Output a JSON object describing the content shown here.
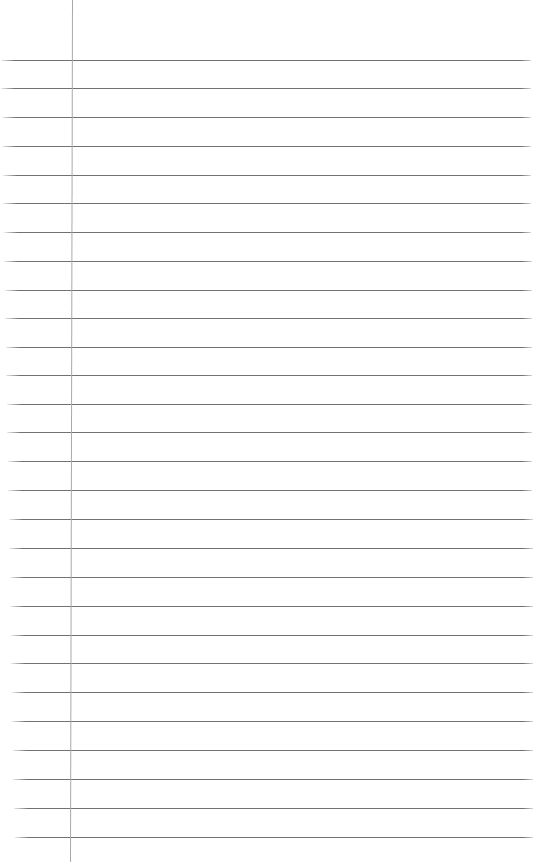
{
  "document": {
    "type": "lined-notebook-paper",
    "page_width": 536,
    "page_height": 866,
    "background_color": "#ffffff",
    "written_text": "",
    "text_content_present": false
  },
  "margin_rule": {
    "name": "vertical-margin-line",
    "color": "#a9a9ad",
    "thickness": 1,
    "x_top": 72,
    "x_bottom": 70,
    "y_start": 0,
    "y_end": 862
  },
  "ruling": {
    "name": "horizontal-rule-lines",
    "color": "#6f7176",
    "thickness": 1,
    "line_count": 28,
    "first_line_y": 60,
    "spacing": 28.8,
    "lines": [
      {
        "y": 60,
        "x_start": 1,
        "x_end": 531
      },
      {
        "y": 88,
        "x_start": 1,
        "x_end": 531
      },
      {
        "y": 117,
        "x_start": 2,
        "x_end": 531
      },
      {
        "y": 146,
        "x_start": 2,
        "x_end": 531
      },
      {
        "y": 175,
        "x_start": 3,
        "x_end": 531
      },
      {
        "y": 203,
        "x_start": 3,
        "x_end": 531
      },
      {
        "y": 232,
        "x_start": 4,
        "x_end": 531
      },
      {
        "y": 261,
        "x_start": 4,
        "x_end": 532
      },
      {
        "y": 290,
        "x_start": 5,
        "x_end": 532
      },
      {
        "y": 318,
        "x_start": 5,
        "x_end": 532
      },
      {
        "y": 347,
        "x_start": 6,
        "x_end": 532
      },
      {
        "y": 375,
        "x_start": 6,
        "x_end": 532
      },
      {
        "y": 404,
        "x_start": 7,
        "x_end": 532
      },
      {
        "y": 432,
        "x_start": 7,
        "x_end": 532
      },
      {
        "y": 461,
        "x_start": 8,
        "x_end": 532
      },
      {
        "y": 490,
        "x_start": 8,
        "x_end": 532
      },
      {
        "y": 519,
        "x_start": 9,
        "x_end": 533
      },
      {
        "y": 548,
        "x_start": 9,
        "x_end": 533
      },
      {
        "y": 577,
        "x_start": 10,
        "x_end": 533
      },
      {
        "y": 606,
        "x_start": 10,
        "x_end": 533
      },
      {
        "y": 635,
        "x_start": 11,
        "x_end": 533
      },
      {
        "y": 663,
        "x_start": 11,
        "x_end": 533
      },
      {
        "y": 692,
        "x_start": 12,
        "x_end": 533
      },
      {
        "y": 721,
        "x_start": 12,
        "x_end": 533
      },
      {
        "y": 750,
        "x_start": 13,
        "x_end": 533
      },
      {
        "y": 779,
        "x_start": 13,
        "x_end": 533
      },
      {
        "y": 808,
        "x_start": 14,
        "x_end": 533
      },
      {
        "y": 837,
        "x_start": 15,
        "x_end": 533
      }
    ]
  }
}
